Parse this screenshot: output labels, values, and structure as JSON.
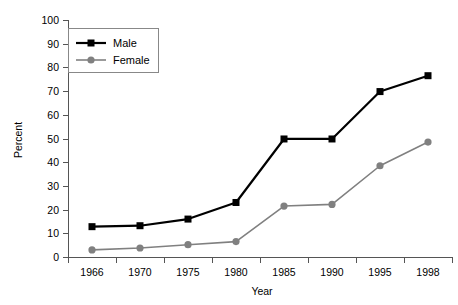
{
  "chart_data": {
    "type": "line",
    "title": "",
    "xlabel": "Year",
    "ylabel": "Percent",
    "categories": [
      "1966",
      "1970",
      "1975",
      "1980",
      "1985",
      "1990",
      "1995",
      "1998"
    ],
    "series": [
      {
        "name": "Male",
        "color": "#000000",
        "marker": "square",
        "values": [
          12.8,
          13.2,
          16.0,
          23.0,
          49.8,
          49.8,
          69.8,
          76.5
        ]
      },
      {
        "name": "Female",
        "color": "#808080",
        "marker": "circle",
        "values": [
          3.0,
          3.8,
          5.2,
          6.5,
          21.5,
          22.2,
          38.5,
          48.5
        ]
      }
    ],
    "ylim": [
      0,
      100
    ],
    "yticks": [
      0,
      10,
      20,
      30,
      40,
      50,
      60,
      70,
      80,
      90,
      100
    ],
    "ytick_labels": [
      "0",
      "10",
      "20",
      "30",
      "40",
      "50",
      "60",
      "70",
      "80",
      "90",
      "100"
    ],
    "grid": false,
    "legend_position": "top-left",
    "legend_entries": [
      "Male",
      "Female"
    ]
  },
  "axes": {
    "y_axis_title": "Percent",
    "x_axis_title": "Year"
  },
  "legend": {
    "male_label": "Male",
    "female_label": "Female"
  }
}
